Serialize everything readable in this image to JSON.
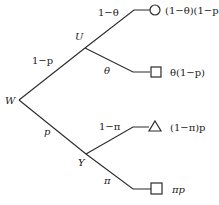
{
  "diagram": {
    "type": "probability-tree",
    "root": {
      "label": "W"
    },
    "nodes": [
      {
        "id": "U",
        "label": "U",
        "edge_label": "1−p"
      },
      {
        "id": "Y",
        "label": "Y",
        "edge_label": "p"
      }
    ],
    "leaves": [
      {
        "parent": "U",
        "edge_label": "1−θ",
        "shape": "circle",
        "outcome": "(1−θ)(1−p)"
      },
      {
        "parent": "U",
        "edge_label": "θ",
        "shape": "square",
        "outcome": "θ(1−p)"
      },
      {
        "parent": "Y",
        "edge_label": "1−π",
        "shape": "triangle",
        "outcome": "(1−π)p"
      },
      {
        "parent": "Y",
        "edge_label": "π",
        "shape": "square",
        "outcome": "πp"
      }
    ],
    "colors": {
      "line": "#2a2a2a",
      "text": "#222222",
      "background": "#ffffff"
    }
  }
}
